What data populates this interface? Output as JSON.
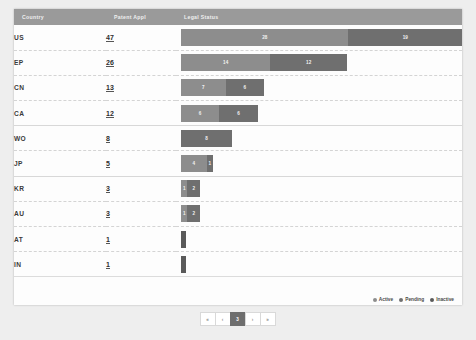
{
  "table": {
    "headers": {
      "country": "Country",
      "count": "Patent Appl",
      "status": "Legal Status"
    },
    "rows": [
      {
        "country": "US",
        "count": "47",
        "segments": [
          {
            "status": "Active",
            "value": "28"
          },
          {
            "status": "Pending",
            "value": "19"
          }
        ]
      },
      {
        "country": "EP",
        "count": "26",
        "segments": [
          {
            "status": "Active",
            "value": "14"
          },
          {
            "status": "Pending",
            "value": "12"
          }
        ]
      },
      {
        "country": "CN",
        "count": "13",
        "segments": [
          {
            "status": "Active",
            "value": "7"
          },
          {
            "status": "Pending",
            "value": "6"
          }
        ]
      },
      {
        "country": "CA",
        "count": "12",
        "segments": [
          {
            "status": "Active",
            "value": "6"
          },
          {
            "status": "Pending",
            "value": "6"
          }
        ]
      },
      {
        "country": "WO",
        "count": "8",
        "segments": [
          {
            "status": "Pending",
            "value": "8"
          }
        ]
      },
      {
        "country": "JP",
        "count": "5",
        "segments": [
          {
            "status": "Active",
            "value": "4"
          },
          {
            "status": "Pending",
            "value": "1"
          }
        ]
      },
      {
        "country": "KR",
        "count": "3",
        "segments": [
          {
            "status": "Active",
            "value": "1"
          },
          {
            "status": "Pending",
            "value": "2"
          }
        ]
      },
      {
        "country": "AU",
        "count": "3",
        "segments": [
          {
            "status": "Active",
            "value": "1"
          },
          {
            "status": "Pending",
            "value": "2"
          }
        ]
      },
      {
        "country": "AT",
        "count": "1",
        "segments": [
          {
            "status": "Inactive",
            "value": ""
          }
        ]
      },
      {
        "country": "IN",
        "count": "1",
        "segments": [
          {
            "status": "Inactive",
            "value": ""
          }
        ]
      }
    ]
  },
  "legend": {
    "items": [
      {
        "label": "Active",
        "color": "#8d8d8d"
      },
      {
        "label": "Pending",
        "color": "#6f6f6f"
      },
      {
        "label": "Inactive",
        "color": "#5a5a5a"
      }
    ]
  },
  "pagination": {
    "pages": [
      {
        "label": "«",
        "current": false
      },
      {
        "label": "‹",
        "current": false
      },
      {
        "label": "3",
        "current": true
      },
      {
        "label": "›",
        "current": false
      },
      {
        "label": "»",
        "current": false
      }
    ]
  },
  "chart_data": {
    "type": "bar",
    "xlabel": "Patent Appl",
    "ylabel": "Country",
    "categories": [
      "US",
      "EP",
      "CN",
      "CA",
      "WO",
      "JP",
      "KR",
      "AU",
      "AT",
      "IN"
    ],
    "totals": [
      47,
      26,
      13,
      12,
      8,
      5,
      3,
      3,
      1,
      1
    ],
    "series": [
      {
        "name": "Active",
        "values": [
          28,
          14,
          7,
          6,
          0,
          4,
          1,
          1,
          0,
          0
        ]
      },
      {
        "name": "Pending",
        "values": [
          19,
          12,
          6,
          6,
          8,
          1,
          2,
          2,
          0,
          0
        ]
      },
      {
        "name": "Inactive",
        "values": [
          0,
          0,
          0,
          0,
          0,
          0,
          0,
          0,
          1,
          1
        ]
      }
    ],
    "xlim": [
      0,
      47
    ],
    "grid": false,
    "legend_position": "bottom-right",
    "stacked": true
  }
}
